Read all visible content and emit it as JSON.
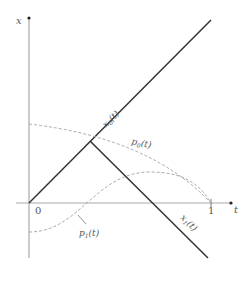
{
  "diagram": {
    "axes": {
      "vertical_label": "x",
      "horizontal_label": "t",
      "origin_label": "0",
      "t_end_label": "1"
    },
    "curves": [
      {
        "id": "x0",
        "label_main": "x",
        "label_sub": "0",
        "label_arg": "(t)",
        "style": "solid"
      },
      {
        "id": "x1",
        "label_main": "x",
        "label_sub": "1",
        "label_arg": "(t)",
        "style": "solid"
      },
      {
        "id": "p0",
        "label_main": "p",
        "label_sub": "0",
        "label_arg": "(t)",
        "style": "dashed"
      },
      {
        "id": "p1",
        "label_main": "p",
        "label_sub": "1",
        "label_arg": "(t)",
        "style": "dashed"
      }
    ],
    "colors": {
      "axis": "#aaaaaa",
      "solid_line": "#333333",
      "dashed_line": "#aaaaaa",
      "text": "#555555"
    },
    "caption": ""
  }
}
